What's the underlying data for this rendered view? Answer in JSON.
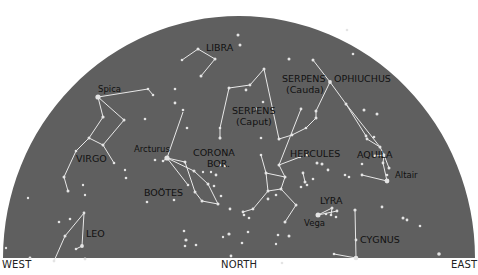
{
  "colors": {
    "sky": "#5f5f5f",
    "star": "#e4e4e4",
    "line": "#e8e8e8",
    "label": "#111111",
    "background": "#ffffff"
  },
  "horizon": {
    "west": "WEST",
    "north": "NORTH",
    "east": "EAST"
  },
  "dome": {
    "cx": 239,
    "cy": 258,
    "rx": 236,
    "ry": 242
  },
  "constellations": [
    {
      "name": "LIBRA",
      "label_x": 206,
      "label_y": 51,
      "size": 9.5
    },
    {
      "name": "SERPENS",
      "sub": "(Cauda)",
      "label_x": 282,
      "label_y": 82,
      "size": 9.5
    },
    {
      "name": "OPHIUCHUS",
      "label_x": 334,
      "label_y": 82,
      "size": 9.5
    },
    {
      "name": "SERPENS",
      "sub": "(Caput)",
      "label_x": 232,
      "label_y": 114,
      "size": 9.5
    },
    {
      "name": "VIRGO",
      "label_x": 76,
      "label_y": 162,
      "size": 9.5
    },
    {
      "name": "CORONA",
      "sub": "BOR.",
      "label_x": 193,
      "label_y": 156,
      "size": 9.5
    },
    {
      "name": "BOÖTES",
      "label_x": 144,
      "label_y": 196,
      "size": 9.5
    },
    {
      "name": "HERCULES",
      "label_x": 290,
      "label_y": 157,
      "size": 9.5
    },
    {
      "name": "AQUILA",
      "label_x": 357,
      "label_y": 158,
      "size": 9.5
    },
    {
      "name": "LYRA",
      "label_x": 320,
      "label_y": 204,
      "size": 9.5
    },
    {
      "name": "CYGNUS",
      "label_x": 360,
      "label_y": 243,
      "size": 9.5
    },
    {
      "name": "LEO",
      "label_x": 86,
      "label_y": 237,
      "size": 9.5
    }
  ],
  "star_names": [
    {
      "name": "Spica",
      "x": 98,
      "y": 92
    },
    {
      "name": "Arcturus",
      "x": 134,
      "y": 152
    },
    {
      "name": "Altair",
      "x": 395,
      "y": 178
    },
    {
      "name": "Vega",
      "x": 304,
      "y": 226
    }
  ],
  "stars": [
    [
      98,
      97,
      2.6
    ],
    [
      148,
      89,
      1.3
    ],
    [
      153,
      95,
      1.3
    ],
    [
      175,
      89,
      1.3
    ],
    [
      103,
      117,
      1.6
    ],
    [
      124,
      120,
      1.5
    ],
    [
      145,
      119,
      1.3
    ],
    [
      89,
      138,
      1.5
    ],
    [
      103,
      145,
      1.5
    ],
    [
      76,
      151,
      1.3
    ],
    [
      114,
      163,
      1.3
    ],
    [
      64,
      177,
      1.5
    ],
    [
      68,
      191,
      1.5
    ],
    [
      83,
      185,
      1.2
    ],
    [
      126,
      178,
      1.3
    ],
    [
      182,
      60,
      1.3
    ],
    [
      198,
      49,
      1.5
    ],
    [
      215,
      59,
      1.5
    ],
    [
      201,
      76,
      1.5
    ],
    [
      238,
      35,
      1.5
    ],
    [
      240,
      45,
      1.5
    ],
    [
      175,
      103,
      1.4
    ],
    [
      183,
      110,
      1.3
    ],
    [
      187,
      128,
      1.3
    ],
    [
      229,
      88,
      1.5
    ],
    [
      264,
      69,
      1.5
    ],
    [
      250,
      85,
      1.4
    ],
    [
      246,
      90,
      1.4
    ],
    [
      263,
      102,
      1.3
    ],
    [
      256,
      109,
      1.4
    ],
    [
      220,
      128,
      1.3
    ],
    [
      220,
      138,
      1.5
    ],
    [
      289,
      59,
      1.5
    ],
    [
      313,
      60,
      1.5
    ],
    [
      330,
      82,
      1.9
    ],
    [
      301,
      109,
      1.4
    ],
    [
      316,
      111,
      1.5
    ],
    [
      316,
      118,
      1.5
    ],
    [
      346,
      104,
      1.5
    ],
    [
      364,
      110,
      1.5
    ],
    [
      377,
      114,
      1.5
    ],
    [
      366,
      136,
      1.4
    ],
    [
      306,
      128,
      1.3
    ],
    [
      292,
      135,
      1.4
    ],
    [
      279,
      139,
      1.5
    ],
    [
      261,
      138,
      1.3
    ],
    [
      347,
      30,
      1.3
    ],
    [
      353,
      54,
      1.3
    ],
    [
      307,
      155,
      1.2
    ],
    [
      155,
      160,
      1.3
    ],
    [
      163,
      161,
      1.3
    ],
    [
      167,
      158,
      2.6
    ],
    [
      185,
      162,
      1.5
    ],
    [
      194,
      171,
      1.5
    ],
    [
      208,
      184,
      1.5
    ],
    [
      188,
      185,
      1.3
    ],
    [
      195,
      192,
      1.5
    ],
    [
      202,
      201,
      1.5
    ],
    [
      218,
      204,
      1.5
    ],
    [
      221,
      196,
      1.3
    ],
    [
      203,
      172,
      1.2
    ],
    [
      211,
      172,
      1.2
    ],
    [
      216,
      175,
      1.4
    ],
    [
      220,
      165,
      1.3
    ],
    [
      225,
      166,
      1.2
    ],
    [
      214,
      186,
      1.3
    ],
    [
      174,
      200,
      1.3
    ],
    [
      147,
      202,
      1.3
    ],
    [
      220,
      138,
      1.2
    ],
    [
      261,
      155,
      1.3
    ],
    [
      266,
      173,
      1.5
    ],
    [
      285,
      177,
      1.5
    ],
    [
      268,
      191,
      1.5
    ],
    [
      281,
      189,
      1.5
    ],
    [
      279,
      165,
      1.5
    ],
    [
      300,
      157,
      1.2
    ],
    [
      303,
      173,
      1.4
    ],
    [
      305,
      182,
      1.5
    ],
    [
      301,
      187,
      1.3
    ],
    [
      268,
      199,
      1.4
    ],
    [
      253,
      209,
      1.4
    ],
    [
      243,
      212,
      1.4
    ],
    [
      276,
      195,
      1.3
    ],
    [
      296,
      205,
      1.5
    ],
    [
      285,
      222,
      1.5
    ],
    [
      317,
      163,
      1.5
    ],
    [
      322,
      164,
      1.5
    ],
    [
      328,
      170,
      1.4
    ],
    [
      307,
      185,
      1.3
    ],
    [
      313,
      179,
      1.3
    ],
    [
      349,
      177,
      1.3
    ],
    [
      345,
      175,
      1.3
    ],
    [
      367,
      139,
      1.4
    ],
    [
      374,
      137,
      1.3
    ],
    [
      380,
      147,
      1.5
    ],
    [
      384,
      155,
      1.4
    ],
    [
      383,
      163,
      1.4
    ],
    [
      375,
      156,
      1.4
    ],
    [
      362,
      164,
      1.3
    ],
    [
      389,
      168,
      1.5
    ],
    [
      387,
      181,
      2.4
    ],
    [
      362,
      175,
      1.4
    ],
    [
      387,
      175,
      1.3
    ],
    [
      318,
      215,
      2.5
    ],
    [
      332,
      208,
      1.5
    ],
    [
      331,
      215,
      1.3
    ],
    [
      337,
      211,
      1.4
    ],
    [
      336,
      217,
      1.3
    ],
    [
      326,
      214,
      1.3
    ],
    [
      355,
      210,
      1.6
    ],
    [
      356,
      240,
      1.4
    ],
    [
      356,
      258,
      2.3
    ],
    [
      334,
      254,
      1.3
    ],
    [
      382,
      207,
      1.4
    ],
    [
      403,
      218,
      1.5
    ],
    [
      407,
      220,
      1.4
    ],
    [
      420,
      226,
      1.3
    ],
    [
      439,
      254,
      1.8
    ],
    [
      84,
      213,
      1.4
    ],
    [
      70,
      219,
      1.3
    ],
    [
      59,
      222,
      1.3
    ],
    [
      85,
      259,
      1.4
    ],
    [
      82,
      246,
      1.9
    ],
    [
      76,
      249,
      1.3
    ],
    [
      65,
      236,
      1.5
    ],
    [
      54,
      261,
      1.4
    ],
    [
      30,
      258,
      1.4
    ],
    [
      184,
      231,
      1.3
    ],
    [
      185,
      246,
      1.3
    ],
    [
      186,
      240,
      1.6
    ],
    [
      230,
      209,
      1.4
    ],
    [
      244,
      215,
      1.3
    ],
    [
      229,
      234,
      1.6
    ],
    [
      242,
      243,
      1.3
    ],
    [
      248,
      232,
      1.3
    ],
    [
      223,
      237,
      1.2
    ],
    [
      278,
      235,
      1.3
    ],
    [
      289,
      236,
      1.5
    ],
    [
      249,
      218,
      1.3
    ],
    [
      276,
      244,
      1.2
    ],
    [
      282,
      263,
      1.3
    ],
    [
      231,
      256,
      1.4
    ],
    [
      196,
      245,
      1.3
    ],
    [
      28,
      198,
      1.2
    ],
    [
      85,
      195,
      1.2
    ],
    [
      125,
      170,
      1.2
    ],
    [
      6,
      248,
      1.2
    ]
  ],
  "lines": [
    [
      [
        98,
        97
      ],
      [
        148,
        89
      ]
    ],
    [
      [
        148,
        89
      ],
      [
        153,
        95
      ]
    ],
    [
      [
        98,
        97
      ],
      [
        103,
        117
      ]
    ],
    [
      [
        98,
        97
      ],
      [
        124,
        120
      ]
    ],
    [
      [
        103,
        117
      ],
      [
        89,
        138
      ]
    ],
    [
      [
        124,
        120
      ],
      [
        103,
        145
      ]
    ],
    [
      [
        89,
        138
      ],
      [
        103,
        145
      ]
    ],
    [
      [
        89,
        138
      ],
      [
        76,
        151
      ]
    ],
    [
      [
        103,
        145
      ],
      [
        114,
        163
      ]
    ],
    [
      [
        76,
        151
      ],
      [
        64,
        177
      ]
    ],
    [
      [
        64,
        177
      ],
      [
        68,
        191
      ]
    ],
    [
      [
        182,
        60
      ],
      [
        198,
        49
      ]
    ],
    [
      [
        198,
        49
      ],
      [
        215,
        59
      ]
    ],
    [
      [
        215,
        59
      ],
      [
        201,
        76
      ]
    ],
    [
      [
        229,
        88
      ],
      [
        250,
        85
      ]
    ],
    [
      [
        250,
        85
      ],
      [
        264,
        69
      ]
    ],
    [
      [
        264,
        69
      ],
      [
        279,
        139
      ]
    ],
    [
      [
        229,
        88
      ],
      [
        220,
        128
      ]
    ],
    [
      [
        220,
        128
      ],
      [
        220,
        138
      ]
    ],
    [
      [
        313,
        60
      ],
      [
        330,
        82
      ]
    ],
    [
      [
        330,
        82
      ],
      [
        316,
        111
      ]
    ],
    [
      [
        316,
        111
      ],
      [
        316,
        118
      ]
    ],
    [
      [
        316,
        118
      ],
      [
        306,
        128
      ]
    ],
    [
      [
        306,
        128
      ],
      [
        292,
        135
      ]
    ],
    [
      [
        292,
        135
      ],
      [
        279,
        139
      ]
    ],
    [
      [
        330,
        82
      ],
      [
        346,
        104
      ]
    ],
    [
      [
        346,
        104
      ],
      [
        366,
        136
      ]
    ],
    [
      [
        167,
        158
      ],
      [
        185,
        162
      ]
    ],
    [
      [
        167,
        158
      ],
      [
        194,
        171
      ]
    ],
    [
      [
        167,
        158
      ],
      [
        188,
        185
      ]
    ],
    [
      [
        185,
        162
      ],
      [
        195,
        192
      ]
    ],
    [
      [
        194,
        171
      ],
      [
        208,
        184
      ]
    ],
    [
      [
        208,
        184
      ],
      [
        218,
        204
      ]
    ],
    [
      [
        195,
        192
      ],
      [
        202,
        201
      ]
    ],
    [
      [
        202,
        201
      ],
      [
        218,
        204
      ]
    ],
    [
      [
        167,
        158
      ],
      [
        163,
        161
      ]
    ],
    [
      [
        167,
        158
      ],
      [
        183,
        112
      ]
    ],
    [
      [
        261,
        155
      ],
      [
        266,
        173
      ]
    ],
    [
      [
        266,
        173
      ],
      [
        268,
        191
      ]
    ],
    [
      [
        266,
        173
      ],
      [
        285,
        177
      ]
    ],
    [
      [
        285,
        177
      ],
      [
        281,
        189
      ]
    ],
    [
      [
        268,
        191
      ],
      [
        281,
        189
      ]
    ],
    [
      [
        285,
        177
      ],
      [
        279,
        165
      ]
    ],
    [
      [
        279,
        165
      ],
      [
        301,
        109
      ]
    ],
    [
      [
        279,
        165
      ],
      [
        300,
        157
      ]
    ],
    [
      [
        281,
        189
      ],
      [
        296,
        205
      ]
    ],
    [
      [
        296,
        205
      ],
      [
        285,
        222
      ]
    ],
    [
      [
        268,
        191
      ],
      [
        253,
        209
      ]
    ],
    [
      [
        253,
        209
      ],
      [
        243,
        212
      ]
    ],
    [
      [
        303,
        173
      ],
      [
        305,
        182
      ]
    ],
    [
      [
        367,
        139
      ],
      [
        380,
        147
      ]
    ],
    [
      [
        380,
        147
      ],
      [
        384,
        155
      ]
    ],
    [
      [
        384,
        155
      ],
      [
        389,
        168
      ]
    ],
    [
      [
        375,
        156
      ],
      [
        384,
        155
      ]
    ],
    [
      [
        384,
        155
      ],
      [
        383,
        163
      ]
    ],
    [
      [
        383,
        163
      ],
      [
        387,
        181
      ]
    ],
    [
      [
        362,
        175
      ],
      [
        387,
        181
      ]
    ],
    [
      [
        346,
        104
      ],
      [
        380,
        147
      ]
    ],
    [
      [
        318,
        215
      ],
      [
        332,
        208
      ]
    ],
    [
      [
        318,
        215
      ],
      [
        337,
        211
      ]
    ],
    [
      [
        332,
        208
      ],
      [
        331,
        215
      ]
    ],
    [
      [
        355,
        210
      ],
      [
        356,
        258
      ]
    ],
    [
      [
        334,
        254
      ],
      [
        356,
        258
      ]
    ],
    [
      [
        84,
        213
      ],
      [
        82,
        246
      ]
    ],
    [
      [
        84,
        213
      ],
      [
        65,
        236
      ]
    ],
    [
      [
        65,
        236
      ],
      [
        54,
        261
      ]
    ],
    [
      [
        82,
        246
      ],
      [
        76,
        249
      ]
    ]
  ]
}
